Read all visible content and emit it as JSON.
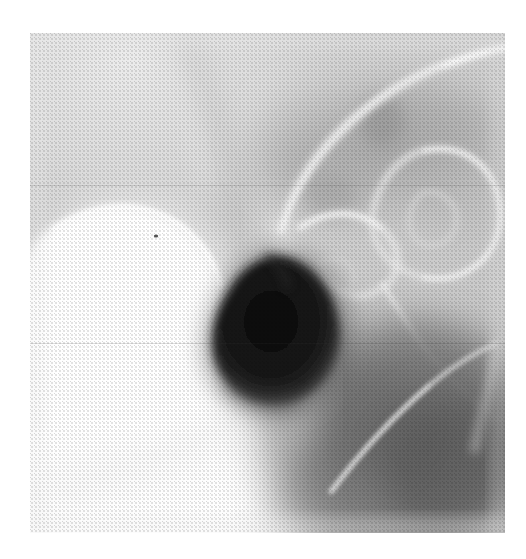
{
  "page": {
    "width": 526,
    "height": 559,
    "background_color": "#ffffff",
    "kind": "scanned-radiograph-figure",
    "caption": ""
  },
  "radiograph": {
    "name": "barium-contrast-radiograph",
    "modality": "X-ray barium contrast study",
    "plate": {
      "x": 30,
      "y": 33,
      "width": 475,
      "height": 500
    },
    "film_base_color": "#c9c9c9",
    "tone_range": {
      "darkest_hex": "#0f0f0f",
      "brightest_hex": "#ffffff"
    },
    "grain": {
      "visible": true,
      "pattern": "halftone-dot",
      "opacity": 0.34
    },
    "seams": [
      {
        "label": "upper-scan-seam",
        "y": 152
      },
      {
        "label": "lower-scan-seam",
        "y": 310
      }
    ],
    "features": [
      {
        "id": "barium-pool",
        "label": "Bright barium-filled rounded collection",
        "position": "left-center",
        "center": {
          "x": 130,
          "y": 295
        },
        "radius": 95,
        "tone_hex": "#ffffff",
        "description": "Homogeneous high-density opacified sac, sharply marginated superolaterally"
      },
      {
        "id": "gas-filled-lesion",
        "label": "Dark gas-filled rounded lesion",
        "position": "center",
        "center": {
          "x": 240,
          "y": 320
        },
        "radius": 78,
        "tone_hex": "#121212",
        "description": "Markedly lucent ovoid cavity abutting the barium pool"
      },
      {
        "id": "superior-arc",
        "label": "Bright curvilinear arc sweeping across upper field",
        "position": "upper-right",
        "tone_hex": "#efefef",
        "description": "Thin high-density line arcing from mid-top toward the right border"
      },
      {
        "id": "bowel-loops",
        "label": "Overlapping curvilinear bowel loop outlines",
        "position": "right-upper",
        "tone_hex": "#e4e4e4",
        "description": "Several ring-like and serpiginous contrast-coated loops"
      },
      {
        "id": "inferior-dense-zone",
        "label": "Broad darker soft-tissue zone",
        "position": "lower-right",
        "tone_hex": "#6d6d6d",
        "description": "Confluent gray region with a bright diagonal interface line"
      },
      {
        "id": "inferior-bright-field",
        "label": "Large bright homogeneous field",
        "position": "lower-left",
        "tone_hex": "#fbfbfb",
        "description": "Broad washed-out bright area occupying the lower-left quadrant"
      },
      {
        "id": "speck",
        "label": "Tiny dark punctate speck",
        "position": "upper margin of barium pool",
        "center": {
          "x": 156,
          "y": 236
        },
        "tone_hex": "#3a3a3a"
      }
    ]
  }
}
